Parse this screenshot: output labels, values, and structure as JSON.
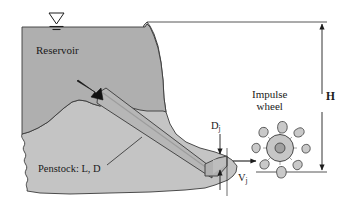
{
  "figure": {
    "type": "engineering-schematic",
    "labels": {
      "reservoir": "Reservoir",
      "penstock": "Penstock: L, D",
      "impulse_wheel_line1": "Impulse",
      "impulse_wheel_line2": "wheel",
      "head": "H",
      "jet_diameter": "D",
      "jet_diameter_sub": "j",
      "jet_velocity": "V",
      "jet_velocity_sub": "j"
    },
    "symbols": {
      "free_surface": "water-surface-triangle",
      "inlet_flow_arrow": "flow-arrow",
      "jet_arrow": "flow-arrow",
      "head_dimension": "double-headed-dimension-arrow",
      "jet_dimension": "double-headed-dimension-arrow"
    },
    "colors": {
      "water": "#b0b0b0",
      "ground": "#c3c3c3",
      "penstock": "#b4b4b4",
      "wheel_disc": "#c6c6c6",
      "wheel_hub": "#9f9f9f",
      "bucket": "#c9c9c9",
      "outline": "#2b2b2b",
      "background": "#ffffff",
      "text": "#1a1a1a"
    },
    "geometry": {
      "head_top_y": 22,
      "head_bottom_y": 172,
      "dimension_x": 322,
      "wheel_center_x": 280,
      "wheel_center_y": 148,
      "wheel_disc_radius": 13,
      "wheel_hub_radius": 5,
      "bucket_count": 8,
      "nozzle_tip_x": 227,
      "jet_centerline_y": 159
    }
  }
}
